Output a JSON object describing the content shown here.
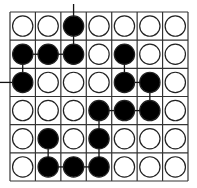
{
  "puzzle": {
    "type": "stone-connection-grid",
    "rows": 6,
    "cols": 7,
    "colors": {
      "black": "#000000",
      "white": "#ffffff",
      "line": "#333333",
      "stone_outline": "#222222"
    },
    "grid": [
      [
        "W",
        "W",
        "B",
        "W",
        "W",
        "W",
        "W"
      ],
      [
        "B",
        "B",
        "B",
        "W",
        "B",
        "W",
        "W"
      ],
      [
        "B",
        "W",
        "W",
        "W",
        "B",
        "B",
        "W"
      ],
      [
        "W",
        "W",
        "W",
        "B",
        "B",
        "B",
        "W"
      ],
      [
        "W",
        "B",
        "W",
        "B",
        "W",
        "W",
        "W"
      ],
      [
        "W",
        "B",
        "B",
        "B",
        "W",
        "W",
        "W"
      ]
    ],
    "connections": [
      [
        [
          0,
          2
        ],
        [
          1,
          2
        ]
      ],
      [
        [
          1,
          0
        ],
        [
          1,
          1
        ]
      ],
      [
        [
          1,
          1
        ],
        [
          1,
          2
        ]
      ],
      [
        [
          1,
          0
        ],
        [
          2,
          0
        ]
      ],
      [
        [
          1,
          4
        ],
        [
          2,
          4
        ]
      ],
      [
        [
          2,
          4
        ],
        [
          2,
          5
        ]
      ],
      [
        [
          2,
          5
        ],
        [
          3,
          5
        ]
      ],
      [
        [
          3,
          3
        ],
        [
          3,
          4
        ]
      ],
      [
        [
          3,
          4
        ],
        [
          3,
          5
        ]
      ],
      [
        [
          3,
          3
        ],
        [
          4,
          3
        ]
      ],
      [
        [
          4,
          3
        ],
        [
          5,
          3
        ]
      ],
      [
        [
          4,
          1
        ],
        [
          5,
          1
        ]
      ],
      [
        [
          5,
          1
        ],
        [
          5,
          2
        ]
      ],
      [
        [
          5,
          2
        ],
        [
          5,
          3
        ]
      ]
    ],
    "edge_stubs": [
      {
        "cell": [
          0,
          2
        ],
        "dir": "up"
      },
      {
        "cell": [
          2,
          0
        ],
        "dir": "left"
      }
    ]
  }
}
